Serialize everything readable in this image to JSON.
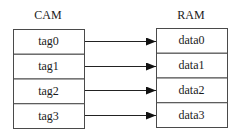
{
  "diagram": {
    "left_title": "CAM",
    "right_title": "RAM",
    "left_cells": [
      "tag0",
      "tag1",
      "tag2",
      "tag3"
    ],
    "right_cells": [
      "data0",
      "data1",
      "data2",
      "data3"
    ],
    "colors": {
      "line": "#4a4a4a",
      "text": "#1a1a1a",
      "background": "#ffffff"
    }
  }
}
